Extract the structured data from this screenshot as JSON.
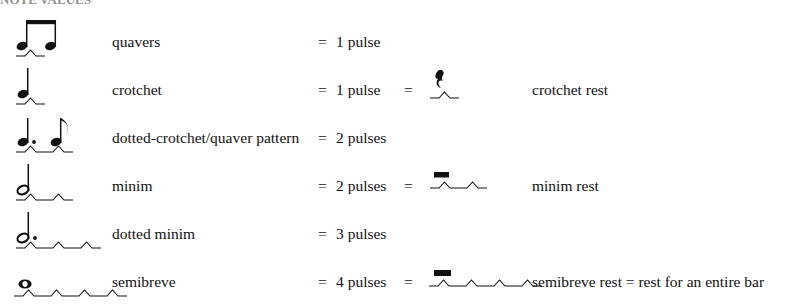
{
  "heading": {
    "text": "NOTE VALUES",
    "note": "clipped at top edge of screenshot"
  },
  "page": {
    "background": "#ffffff",
    "ink": "#111111",
    "width": 787,
    "height": 304
  },
  "columns": {
    "notation": "notation",
    "name": "name",
    "equals": "=",
    "pulses": "pulse value",
    "rest_notation": "rest notation",
    "rest_name": "rest name"
  },
  "rows": [
    {
      "notation_icon": "beamed-quavers-icon",
      "name": "quavers",
      "equals": "=",
      "pulses": "1 pulse",
      "pulse_count": 1,
      "has_rest": false,
      "rest_equals": "",
      "rest_icon": "",
      "rest_name": ""
    },
    {
      "notation_icon": "crotchet-icon",
      "name": "crotchet",
      "equals": "=",
      "pulses": "1 pulse",
      "pulse_count": 1,
      "has_rest": true,
      "rest_equals": "=",
      "rest_icon": "crotchet-rest-icon",
      "rest_name": "crotchet rest"
    },
    {
      "notation_icon": "dotted-crotchet-quaver-icon",
      "name": "dotted-crotchet/quaver pattern",
      "equals": "=",
      "pulses": "2 pulses",
      "pulse_count": 2,
      "has_rest": false,
      "rest_equals": "",
      "rest_icon": "",
      "rest_name": ""
    },
    {
      "notation_icon": "minim-icon",
      "name": "minim",
      "equals": "=",
      "pulses": "2 pulses",
      "pulse_count": 2,
      "has_rest": true,
      "rest_equals": "=",
      "rest_icon": "minim-rest-icon",
      "rest_name": "minim rest"
    },
    {
      "notation_icon": "dotted-minim-icon",
      "name": "dotted minim",
      "equals": "=",
      "pulses": "3 pulses",
      "pulse_count": 3,
      "has_rest": false,
      "rest_equals": "",
      "rest_icon": "",
      "rest_name": ""
    },
    {
      "notation_icon": "semibreve-icon",
      "name": "semibreve",
      "equals": "=",
      "pulses": "4 pulses",
      "pulse_count": 4,
      "has_rest": true,
      "rest_equals": "=",
      "rest_icon": "semibreve-rest-icon",
      "rest_name": "semibreve rest = rest for an entire bar"
    }
  ]
}
